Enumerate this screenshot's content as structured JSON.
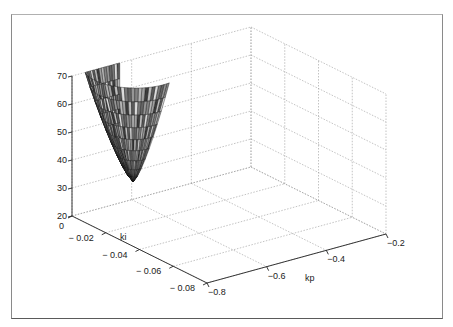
{
  "chart_data": {
    "type": "surface3d",
    "title": "",
    "xlabel": "kp",
    "ylabel": "ki",
    "zlabel": "",
    "x_ticks": [
      "-0.8",
      "-0.6",
      "-0.4",
      "-0.2"
    ],
    "y_ticks": [
      "0",
      "-0.02",
      "-0.04",
      "-0.06",
      "-0.08"
    ],
    "z_ticks": [
      "20",
      "30",
      "40",
      "50",
      "60",
      "70"
    ],
    "xlim": [
      -0.8,
      -0.2
    ],
    "ylim": [
      -0.08,
      0
    ],
    "zlim": [
      20,
      70
    ],
    "grid": true,
    "surface": {
      "description": "Bowl/funnel-shaped stepped surface, minimum ≈ 30 near kp≈-0.65, ki≈-0.02; rises to ≈ 70 at the outer rim",
      "kp_range": [
        -0.75,
        -0.45
      ],
      "ki_range": [
        -0.03,
        0.0
      ],
      "z_min": 30,
      "z_max": 70,
      "color_style": "grayscale shaded mesh"
    }
  },
  "axes": {
    "x_label": "kp",
    "y_label": "ki",
    "x_tick_labels": [
      "-0.8",
      "-0.6",
      "-0.4",
      "-0.2"
    ],
    "y_tick_labels": [
      "0",
      "-0.02",
      "-0.04",
      "-0.06",
      "-0.08"
    ],
    "z_tick_labels": [
      "20",
      "30",
      "40",
      "50",
      "60",
      "70"
    ]
  }
}
